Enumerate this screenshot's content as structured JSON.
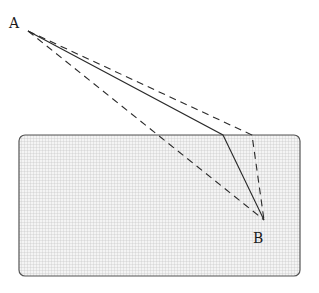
{
  "diagram": {
    "points": {
      "A": {
        "label": "A",
        "x": 28,
        "y": 31
      },
      "B": {
        "label": "B",
        "x": 264,
        "y": 220
      }
    },
    "region": {
      "x": 19,
      "y": 135,
      "width": 281,
      "height": 141,
      "corner_radius": 6,
      "fill_pattern": "grid-stipple",
      "border_color": "#555555"
    },
    "paths": [
      {
        "name": "refracted-path-solid",
        "style": "solid",
        "points": [
          [
            28,
            31
          ],
          [
            223,
            135
          ],
          [
            264,
            220
          ]
        ]
      },
      {
        "name": "refracted-path-dashed",
        "style": "dashed",
        "points": [
          [
            28,
            31
          ],
          [
            252,
            135
          ],
          [
            264,
            220
          ]
        ]
      },
      {
        "name": "straight-path-dashed",
        "style": "dashed",
        "points": [
          [
            28,
            31
          ],
          [
            264,
            220
          ]
        ]
      }
    ],
    "colors": {
      "line": "#2a2a2a",
      "grid": "#bdbdbd",
      "region_bg": "#f2f2f2"
    }
  }
}
